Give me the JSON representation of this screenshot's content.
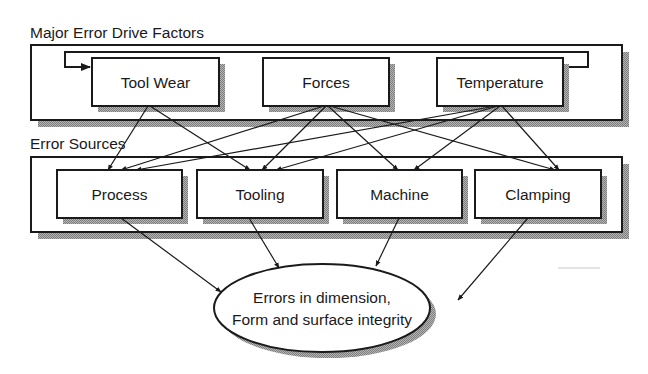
{
  "sections": {
    "drive_factors": {
      "title": "Major Error Drive Factors",
      "nodes": [
        {
          "id": "tool_wear",
          "label": "Tool Wear"
        },
        {
          "id": "forces",
          "label": "Forces"
        },
        {
          "id": "temperature",
          "label": "Temperature"
        }
      ]
    },
    "error_sources": {
      "title": "Error Sources",
      "nodes": [
        {
          "id": "process",
          "label": "Process"
        },
        {
          "id": "tooling",
          "label": "Tooling"
        },
        {
          "id": "machine",
          "label": "Machine"
        },
        {
          "id": "clamping",
          "label": "Clamping"
        }
      ]
    }
  },
  "outcome": {
    "line1": "Errors in dimension,",
    "line2": "Form and surface integrity"
  },
  "edges": [
    {
      "from": "temperature",
      "to": "tool_wear",
      "type": "feedback-loop"
    },
    {
      "from": "tool_wear",
      "to": "process"
    },
    {
      "from": "tool_wear",
      "to": "tooling"
    },
    {
      "from": "forces",
      "to": "process"
    },
    {
      "from": "forces",
      "to": "tooling"
    },
    {
      "from": "forces",
      "to": "machine"
    },
    {
      "from": "forces",
      "to": "clamping"
    },
    {
      "from": "temperature",
      "to": "process"
    },
    {
      "from": "temperature",
      "to": "tooling"
    },
    {
      "from": "temperature",
      "to": "machine"
    },
    {
      "from": "temperature",
      "to": "clamping"
    },
    {
      "from": "process",
      "to": "outcome"
    },
    {
      "from": "tooling",
      "to": "outcome"
    },
    {
      "from": "machine",
      "to": "outcome"
    },
    {
      "from": "clamping",
      "to": "outcome"
    }
  ],
  "colors": {
    "line": "#1a1a1a",
    "shadow": "#9a9a9a",
    "fill": "#ffffff"
  }
}
